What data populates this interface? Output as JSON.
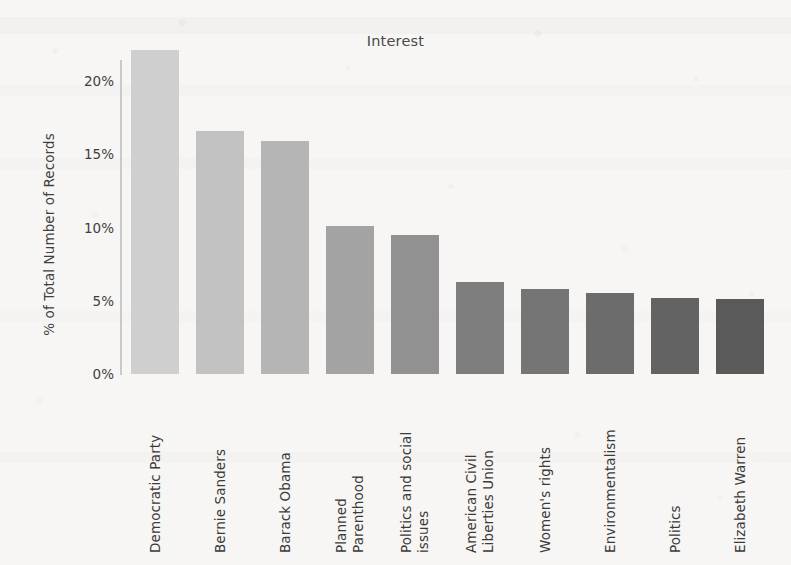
{
  "chart_data": {
    "type": "bar",
    "title": "Interest",
    "xlabel": "",
    "ylabel": "% of Total Number of Records",
    "ylim": [
      0,
      22.8
    ],
    "grid": false,
    "legend": "none",
    "orientation": "vertical",
    "y_tick_labels": [
      "0%",
      "5%",
      "10%",
      "15%",
      "20%"
    ],
    "y_tick_values": [
      0,
      5,
      10,
      15,
      20
    ],
    "value_suffix": "%",
    "categories": [
      "Democratic Party",
      "Bernie Sanders",
      "Barack Obama",
      "Planned Parenthood",
      "Politics and social issues",
      "American Civil Liberties Union",
      "Women's rights",
      "Environmentalism",
      "Politics",
      "Elizabeth Warren"
    ],
    "category_lines": [
      [
        "Democratic Party"
      ],
      [
        "Bernie Sanders"
      ],
      [
        "Barack Obama"
      ],
      [
        "Planned",
        "Parenthood"
      ],
      [
        "Politics and social",
        "issues"
      ],
      [
        "American Civil",
        "Liberties Union"
      ],
      [
        "Women's rights"
      ],
      [
        "Environmentalism"
      ],
      [
        "Politics"
      ],
      [
        "Elizabeth Warren"
      ]
    ],
    "values": [
      22.1,
      16.6,
      15.9,
      10.1,
      9.5,
      6.3,
      5.8,
      5.5,
      5.2,
      5.1
    ],
    "bar_colors": [
      "#cfcfcf",
      "#c2c2c2",
      "#b5b5b5",
      "#a3a3a3",
      "#919191",
      "#7d7d7d",
      "#757575",
      "#6c6c6c",
      "#636363",
      "#5a5a5a"
    ]
  },
  "style": {
    "background": "#f7f6f4",
    "axis_color": "#c9c9c9",
    "text_color": "#3f3f3f",
    "title_color": "#4a4a4a"
  }
}
